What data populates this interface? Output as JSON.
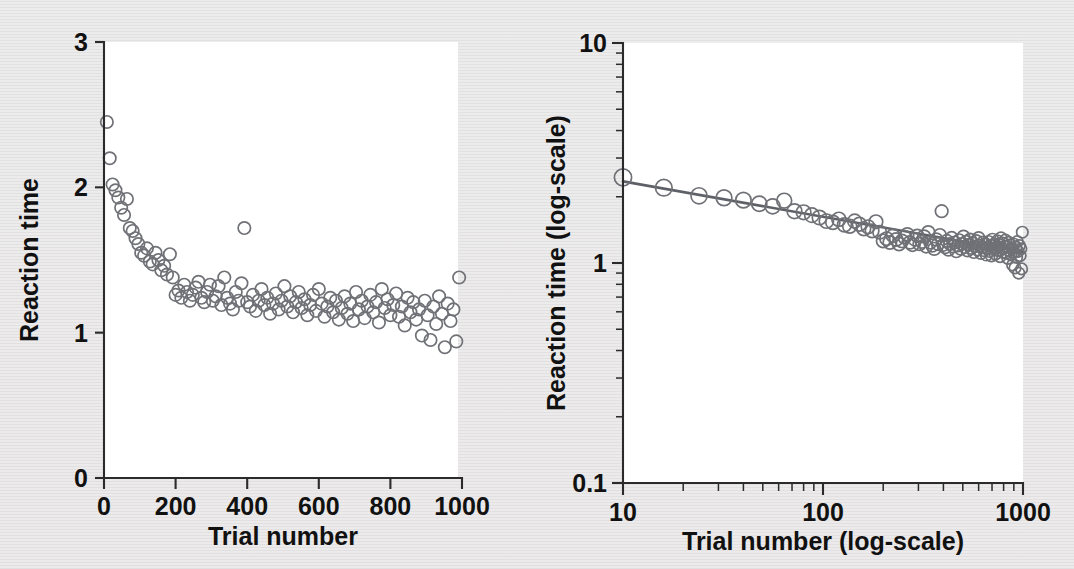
{
  "figure": {
    "background_color": "#ececec",
    "plot_area_color": "#ffffff",
    "point_stroke_color": "#6f7176",
    "fit_line_color": "#5d6066",
    "axis_color": "#2b2b2b"
  },
  "panels": {
    "left": {
      "name": "linear-scale-panel",
      "xlabel": "Trial number",
      "ylabel": "Reaction time",
      "xticks": [
        "0",
        "200",
        "400",
        "600",
        "800",
        "1000"
      ],
      "yticks": [
        "0",
        "1",
        "2",
        "3"
      ]
    },
    "right": {
      "name": "log-log-panel",
      "xlabel": "Trial number (log-scale)",
      "ylabel": "Reaction time (log-scale)",
      "xticks": [
        "10",
        "100",
        "1000"
      ],
      "yticks": [
        "0.1",
        "1",
        "10"
      ]
    }
  },
  "chart_data": [
    {
      "type": "scatter",
      "id": "reaction-time-linear",
      "title": "",
      "xlabel": "Trial number",
      "ylabel": "Reaction time",
      "xlim": [
        0,
        1000
      ],
      "ylim": [
        0,
        3
      ],
      "xticks": [
        0,
        200,
        400,
        600,
        800,
        1000
      ],
      "yticks": [
        0,
        1,
        2,
        3
      ],
      "xscale": "linear",
      "yscale": "linear",
      "grid": false,
      "legend": "none",
      "marker": "open-circle",
      "x": [
        8,
        16,
        24,
        32,
        40,
        48,
        56,
        64,
        72,
        80,
        88,
        96,
        104,
        112,
        120,
        128,
        136,
        144,
        152,
        160,
        168,
        176,
        184,
        192,
        200,
        208,
        216,
        224,
        232,
        240,
        248,
        256,
        264,
        272,
        280,
        288,
        296,
        304,
        312,
        320,
        328,
        336,
        344,
        352,
        360,
        368,
        376,
        384,
        392,
        400,
        408,
        416,
        424,
        432,
        440,
        448,
        456,
        464,
        472,
        480,
        488,
        496,
        504,
        512,
        520,
        528,
        536,
        544,
        552,
        560,
        568,
        576,
        584,
        592,
        600,
        608,
        616,
        624,
        632,
        640,
        648,
        656,
        664,
        672,
        680,
        688,
        696,
        704,
        712,
        720,
        728,
        736,
        744,
        752,
        760,
        768,
        776,
        784,
        792,
        800,
        808,
        816,
        824,
        832,
        840,
        848,
        856,
        864,
        872,
        880,
        888,
        896,
        904,
        912,
        920,
        928,
        936,
        944,
        952,
        960,
        968,
        976,
        984,
        992
      ],
      "y": [
        2.45,
        2.2,
        2.02,
        1.98,
        1.93,
        1.86,
        1.81,
        1.92,
        1.72,
        1.7,
        1.65,
        1.61,
        1.55,
        1.53,
        1.58,
        1.49,
        1.47,
        1.55,
        1.5,
        1.43,
        1.46,
        1.4,
        1.54,
        1.38,
        1.26,
        1.29,
        1.24,
        1.33,
        1.28,
        1.22,
        1.26,
        1.31,
        1.35,
        1.24,
        1.21,
        1.28,
        1.33,
        1.22,
        1.25,
        1.32,
        1.19,
        1.38,
        1.24,
        1.2,
        1.16,
        1.28,
        1.22,
        1.34,
        1.72,
        1.21,
        1.18,
        1.26,
        1.15,
        1.22,
        1.3,
        1.19,
        1.24,
        1.13,
        1.2,
        1.27,
        1.16,
        1.22,
        1.32,
        1.18,
        1.25,
        1.14,
        1.21,
        1.28,
        1.17,
        1.23,
        1.12,
        1.19,
        1.26,
        1.15,
        1.3,
        1.2,
        1.11,
        1.18,
        1.24,
        1.14,
        1.22,
        1.09,
        1.17,
        1.25,
        1.13,
        1.2,
        1.08,
        1.28,
        1.16,
        1.22,
        1.1,
        1.18,
        1.26,
        1.14,
        1.21,
        1.07,
        1.3,
        1.17,
        1.23,
        1.12,
        1.19,
        1.27,
        1.11,
        1.18,
        1.05,
        1.24,
        1.14,
        1.21,
        1.09,
        1.16,
        0.98,
        1.22,
        1.12,
        0.95,
        1.18,
        1.06,
        1.25,
        1.13,
        0.9,
        1.2,
        1.08,
        1.16,
        0.94,
        1.38
      ]
    },
    {
      "type": "scatter",
      "id": "reaction-time-loglog",
      "title": "",
      "xlabel": "Trial number (log-scale)",
      "ylabel": "Reaction time (log-scale)",
      "xlim": [
        10,
        1000
      ],
      "ylim": [
        0.1,
        10
      ],
      "xticks": [
        10,
        100,
        1000
      ],
      "yticks": [
        0.1,
        1,
        10
      ],
      "xscale": "log",
      "yscale": "log",
      "grid": false,
      "legend": "none",
      "marker": "open-circle",
      "fit_line": {
        "type": "power-law",
        "description": "linear fit in log-log space",
        "x": [
          10,
          1000
        ],
        "y": [
          2.35,
          1.12
        ]
      },
      "x": [
        10,
        16,
        24,
        32,
        40,
        48,
        56,
        64,
        72,
        80,
        88,
        96,
        104,
        112,
        120,
        128,
        136,
        144,
        152,
        160,
        168,
        176,
        184,
        192,
        200,
        208,
        216,
        224,
        232,
        240,
        248,
        256,
        264,
        272,
        280,
        288,
        296,
        304,
        312,
        320,
        328,
        336,
        344,
        352,
        360,
        368,
        376,
        384,
        392,
        400,
        408,
        416,
        424,
        432,
        440,
        448,
        456,
        464,
        472,
        480,
        488,
        496,
        504,
        512,
        520,
        528,
        536,
        544,
        552,
        560,
        568,
        576,
        584,
        592,
        600,
        608,
        616,
        624,
        632,
        640,
        648,
        656,
        664,
        672,
        680,
        688,
        696,
        704,
        712,
        720,
        728,
        736,
        744,
        752,
        760,
        768,
        776,
        784,
        792,
        800,
        808,
        816,
        824,
        832,
        840,
        848,
        856,
        864,
        872,
        880,
        888,
        896,
        904,
        912,
        920,
        928,
        936,
        944,
        952,
        960,
        968,
        976,
        984,
        992
      ],
      "y": [
        2.45,
        2.2,
        2.02,
        1.98,
        1.93,
        1.86,
        1.81,
        1.92,
        1.72,
        1.7,
        1.65,
        1.61,
        1.55,
        1.53,
        1.58,
        1.49,
        1.47,
        1.55,
        1.5,
        1.43,
        1.46,
        1.4,
        1.54,
        1.38,
        1.26,
        1.29,
        1.24,
        1.33,
        1.28,
        1.22,
        1.26,
        1.31,
        1.35,
        1.24,
        1.21,
        1.28,
        1.33,
        1.22,
        1.25,
        1.32,
        1.19,
        1.38,
        1.24,
        1.2,
        1.16,
        1.28,
        1.22,
        1.34,
        1.72,
        1.21,
        1.18,
        1.26,
        1.15,
        1.22,
        1.3,
        1.19,
        1.24,
        1.13,
        1.2,
        1.27,
        1.16,
        1.22,
        1.32,
        1.18,
        1.25,
        1.14,
        1.21,
        1.28,
        1.17,
        1.23,
        1.12,
        1.19,
        1.26,
        1.15,
        1.3,
        1.2,
        1.11,
        1.18,
        1.24,
        1.14,
        1.22,
        1.09,
        1.17,
        1.25,
        1.13,
        1.2,
        1.08,
        1.28,
        1.16,
        1.22,
        1.1,
        1.18,
        1.26,
        1.14,
        1.21,
        1.07,
        1.3,
        1.17,
        1.23,
        1.12,
        1.19,
        1.27,
        1.11,
        1.18,
        1.05,
        1.24,
        1.14,
        1.21,
        1.09,
        1.16,
        0.98,
        1.22,
        1.12,
        0.95,
        1.18,
        1.06,
        1.25,
        1.13,
        0.9,
        1.2,
        1.08,
        1.16,
        0.94,
        1.38
      ]
    }
  ]
}
